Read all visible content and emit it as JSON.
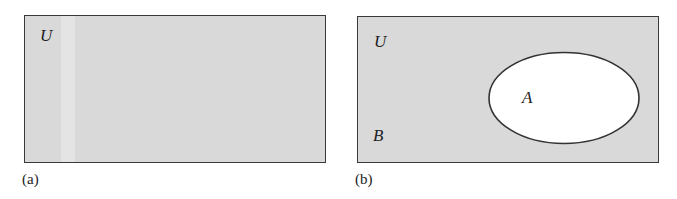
{
  "panels": [
    {
      "caption": "(a)",
      "universe_label": "U",
      "fill_color": "#d9d9d9"
    },
    {
      "caption": "(b)",
      "universe_label": "U",
      "complement_label": "B",
      "set_label": "A",
      "fill_color": "#d9d9d9",
      "set_fill_color": "#ffffff"
    }
  ]
}
